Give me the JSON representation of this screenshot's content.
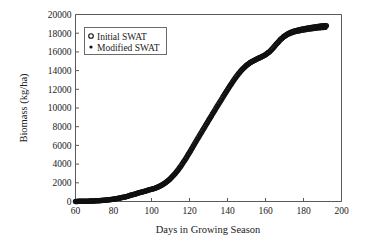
{
  "figure": {
    "background_color": "#ffffff",
    "axis_color": "#5a5a5a",
    "series_color": "#111111"
  },
  "chart_data": {
    "type": "scatter",
    "title": "",
    "xlabel": "Days in Growing Season",
    "ylabel": "Biomass (kg/ha)",
    "xlim": [
      60,
      200
    ],
    "ylim": [
      0,
      20000
    ],
    "xticks": [
      60,
      80,
      100,
      120,
      140,
      160,
      180,
      200
    ],
    "yticks": [
      0,
      2000,
      4000,
      6000,
      8000,
      10000,
      12000,
      14000,
      16000,
      18000,
      20000
    ],
    "xtick_labels": [
      "60",
      "80",
      "100",
      "120",
      "140",
      "160",
      "180",
      "200"
    ],
    "ytick_labels": [
      "0",
      "2000",
      "4000",
      "6000",
      "8000",
      "10000",
      "12000",
      "14000",
      "16000",
      "18000",
      "20000"
    ],
    "grid": false,
    "legend_position": "upper-left-inside",
    "legend": [
      {
        "name": "Initial SWAT",
        "marker": "open-circle"
      },
      {
        "name": "Modified SWAT",
        "marker": "filled-dot"
      }
    ],
    "x": [
      60,
      62,
      64,
      66,
      68,
      70,
      72,
      74,
      76,
      78,
      80,
      82,
      84,
      86,
      88,
      90,
      92,
      94,
      96,
      98,
      100,
      102,
      104,
      106,
      108,
      110,
      112,
      114,
      116,
      118,
      120,
      122,
      124,
      126,
      128,
      130,
      132,
      134,
      136,
      138,
      140,
      142,
      144,
      146,
      148,
      150,
      152,
      154,
      156,
      158,
      160,
      162,
      164,
      166,
      168,
      170,
      172,
      174,
      176,
      178,
      180,
      182,
      184,
      186,
      188,
      190,
      192
    ],
    "series": [
      {
        "name": "Initial SWAT",
        "marker": "open-circle",
        "values": [
          10,
          15,
          22,
          32,
          45,
          62,
          85,
          115,
          150,
          195,
          250,
          315,
          395,
          490,
          600,
          720,
          840,
          960,
          1080,
          1190,
          1300,
          1430,
          1600,
          1820,
          2100,
          2450,
          2880,
          3380,
          3950,
          4580,
          5240,
          5930,
          6620,
          7300,
          7980,
          8650,
          9320,
          9990,
          10650,
          11300,
          11950,
          12580,
          13180,
          13720,
          14180,
          14560,
          14860,
          15090,
          15290,
          15480,
          15700,
          16000,
          16420,
          16900,
          17350,
          17700,
          17960,
          18140,
          18270,
          18370,
          18450,
          18530,
          18600,
          18660,
          18720,
          18770,
          18810
        ]
      },
      {
        "name": "Modified SWAT",
        "marker": "filled-dot",
        "values": [
          8,
          13,
          20,
          29,
          41,
          57,
          79,
          108,
          142,
          186,
          240,
          303,
          381,
          474,
          582,
          700,
          818,
          936,
          1054,
          1162,
          1270,
          1398,
          1565,
          1782,
          2058,
          2405,
          2830,
          3325,
          3890,
          4515,
          5170,
          5855,
          6540,
          7215,
          7890,
          8555,
          9220,
          9885,
          10540,
          11185,
          11830,
          12455,
          13050,
          13585,
          14040,
          14415,
          14710,
          14935,
          15130,
          15315,
          15530,
          15820,
          16230,
          16700,
          17140,
          17480,
          17730,
          17900,
          18020,
          18110,
          18180,
          18250,
          18310,
          18360,
          18410,
          18450,
          18490
        ]
      }
    ]
  }
}
